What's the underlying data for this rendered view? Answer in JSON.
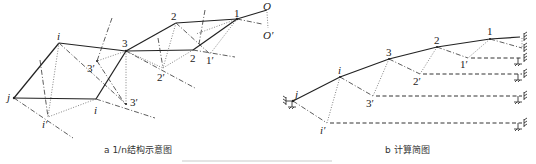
{
  "figure": {
    "panel_a": {
      "caption": "a 1/n结构示意图",
      "labels": {
        "O": "O",
        "O_prime": "O′",
        "n1": "1",
        "n1_prime": "1′",
        "n2_top": "2",
        "n2_low": "2",
        "n2_prime": "2′",
        "n3": "3",
        "n3_prime_up": "3′",
        "n3_prime_low": "3′",
        "i_top": "i",
        "i_low": "i",
        "i_prime": "i′",
        "j": "j"
      }
    },
    "panel_b": {
      "caption": "b 计算简图",
      "labels": {
        "j": "j",
        "i": "i",
        "n3": "3",
        "n2": "2",
        "n1": "1",
        "n1_prime": "1′",
        "n2_prime": "2′",
        "n3_prime": "3′",
        "i_prime": "i′"
      }
    }
  }
}
